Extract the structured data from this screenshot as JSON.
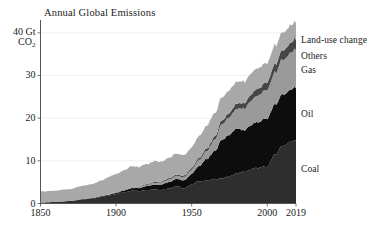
{
  "chart_data": {
    "type": "area",
    "stacked": true,
    "title": "Annual Global Emissions",
    "xlabel": "",
    "ylabel": "40 Gt CO2",
    "ylim": [
      0,
      43
    ],
    "xlim": [
      1850,
      2019
    ],
    "grid": true,
    "legend_position": "right-of-plot-inline",
    "yticks": [
      "0",
      "10",
      "20",
      "30",
      "40 Gt"
    ],
    "ytick_values": [
      0,
      10,
      20,
      30,
      40
    ],
    "y_unit_line1": "40 Gt",
    "y_unit_line2_prefix": "CO",
    "y_unit_line2_sub": "2",
    "xticks": [
      "1850",
      "1900",
      "1950",
      "2000",
      "2019"
    ],
    "xtick_values": [
      1850,
      1900,
      1950,
      2000,
      2019
    ],
    "x": [
      1850,
      1855,
      1860,
      1865,
      1870,
      1875,
      1880,
      1885,
      1890,
      1895,
      1900,
      1905,
      1910,
      1915,
      1920,
      1925,
      1930,
      1935,
      1940,
      1945,
      1950,
      1955,
      1960,
      1965,
      1970,
      1975,
      1980,
      1985,
      1990,
      1995,
      2000,
      2005,
      2010,
      2015,
      2019
    ],
    "series": [
      {
        "name": "Coal",
        "color": "#2e2e2e",
        "values": [
          0.2,
          0.3,
          0.4,
          0.5,
          0.6,
          0.8,
          1.0,
          1.2,
          1.5,
          1.8,
          2.2,
          2.6,
          3.0,
          2.9,
          3.1,
          3.3,
          3.2,
          3.5,
          4.1,
          3.5,
          4.4,
          5.2,
          5.4,
          5.6,
          5.8,
          6.4,
          7.0,
          7.5,
          8.2,
          8.4,
          8.6,
          11.3,
          13.5,
          14.5,
          14.7
        ]
      },
      {
        "name": "Oil",
        "color": "#0d0d0d",
        "values": [
          0.0,
          0.0,
          0.0,
          0.0,
          0.0,
          0.1,
          0.1,
          0.1,
          0.2,
          0.2,
          0.3,
          0.4,
          0.6,
          0.7,
          0.9,
          1.1,
          1.3,
          1.5,
          1.7,
          1.9,
          2.5,
          3.6,
          4.9,
          6.6,
          9.1,
          9.8,
          10.5,
          9.8,
          10.5,
          10.9,
          11.3,
          11.7,
          12.0,
          12.2,
          12.3
        ]
      },
      {
        "name": "Gas",
        "color": "#9a9a9a",
        "values": [
          0.0,
          0.0,
          0.0,
          0.0,
          0.0,
          0.0,
          0.0,
          0.0,
          0.0,
          0.1,
          0.1,
          0.1,
          0.2,
          0.2,
          0.3,
          0.4,
          0.5,
          0.6,
          0.7,
          0.8,
          1.0,
          1.4,
          1.9,
          2.6,
          3.6,
          4.2,
          4.7,
          5.1,
          5.9,
          6.3,
          6.8,
          7.4,
          8.2,
          8.6,
          8.9
        ]
      },
      {
        "name": "Others",
        "color": "#464646",
        "values": [
          0.0,
          0.0,
          0.0,
          0.0,
          0.0,
          0.0,
          0.0,
          0.0,
          0.0,
          0.0,
          0.1,
          0.1,
          0.1,
          0.1,
          0.2,
          0.2,
          0.2,
          0.3,
          0.3,
          0.3,
          0.4,
          0.5,
          0.6,
          0.7,
          0.9,
          1.0,
          1.2,
          1.3,
          1.5,
          1.6,
          1.8,
          2.0,
          2.2,
          2.4,
          2.5
        ]
      },
      {
        "name": "Land-use change",
        "color": "#a8a8a8",
        "values": [
          2.6,
          2.6,
          2.6,
          2.7,
          2.8,
          3.0,
          3.2,
          3.4,
          3.7,
          4.0,
          4.2,
          4.5,
          4.8,
          4.6,
          4.7,
          4.9,
          4.6,
          4.8,
          5.0,
          4.7,
          4.9,
          5.1,
          5.3,
          5.4,
          5.5,
          5.3,
          5.2,
          5.0,
          4.9,
          4.7,
          4.5,
          4.3,
          4.2,
          4.1,
          4.0
        ]
      }
    ],
    "annotations": [
      {
        "label": "Land-use change",
        "y_value": 38.2
      },
      {
        "label": "Others",
        "y_value": 34.6
      },
      {
        "label": "Gas",
        "y_value": 31.2
      },
      {
        "label": "Oil",
        "y_value": 21.0
      },
      {
        "label": "Coal",
        "y_value": 8.0
      }
    ]
  }
}
